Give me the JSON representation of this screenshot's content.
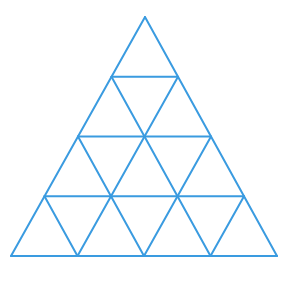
{
  "diagram": {
    "title": "",
    "stroke_color": "#3a9be0",
    "background": "#ffffff",
    "rows": 4,
    "vertices": {
      "apex": [
        145,
        17
      ],
      "bottom_left": [
        11,
        256
      ],
      "bottom_right": [
        277,
        256
      ]
    }
  }
}
